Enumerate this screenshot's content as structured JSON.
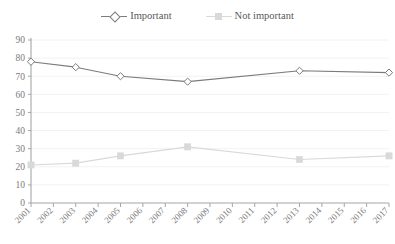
{
  "legend": {
    "position": "top-center",
    "items": [
      {
        "label": "Important",
        "marker": "diamond-open-marker",
        "color": "#7b7b7b"
      },
      {
        "label": "Not important",
        "marker": "square-filled-marker",
        "color": "#d9d9d9"
      }
    ]
  },
  "colors": {
    "important_line": "#7b7b7b",
    "not_important_line": "#d9d9d9",
    "axis": "#a6a6a6",
    "gridline": "#f2f2f2",
    "text": "#7b7b7b"
  },
  "chart_data": {
    "type": "line",
    "title": "",
    "xlabel": "",
    "ylabel": "",
    "ylim": [
      0,
      90
    ],
    "ytick_step": 10,
    "yticks": [
      "0",
      "10",
      "20",
      "30",
      "40",
      "50",
      "60",
      "70",
      "80",
      "90"
    ],
    "grid": "horizontal",
    "categories": [
      "2001",
      "2002",
      "2003",
      "2004",
      "2005",
      "2006",
      "2007",
      "2008",
      "2009",
      "2010",
      "2011",
      "2012",
      "2013",
      "2014",
      "2015",
      "2016",
      "2017"
    ],
    "series": [
      {
        "name": "Important",
        "marker": "diamond-open-marker",
        "color": "#7b7b7b",
        "points": [
          {
            "x": "2001",
            "y": 78
          },
          {
            "x": "2003",
            "y": 75
          },
          {
            "x": "2005",
            "y": 70
          },
          {
            "x": "2008",
            "y": 67
          },
          {
            "x": "2013",
            "y": 73
          },
          {
            "x": "2017",
            "y": 72
          }
        ]
      },
      {
        "name": "Not important",
        "marker": "square-filled-marker",
        "color": "#d9d9d9",
        "points": [
          {
            "x": "2001",
            "y": 21
          },
          {
            "x": "2003",
            "y": 22
          },
          {
            "x": "2005",
            "y": 26
          },
          {
            "x": "2008",
            "y": 31
          },
          {
            "x": "2013",
            "y": 24
          },
          {
            "x": "2017",
            "y": 26
          }
        ]
      }
    ]
  }
}
